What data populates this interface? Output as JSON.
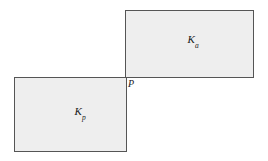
{
  "figure": {
    "background_color": "#ffffff",
    "width": 268,
    "height": 161,
    "shapes": [
      {
        "name": "upper-rectangle",
        "label_base": "K",
        "label_subscript": "a",
        "fill_color": "#eeeeee",
        "stroke_color": "#555555",
        "x": 125,
        "y": 10,
        "width": 129,
        "height": 68,
        "label_cx": 193,
        "label_cy": 41
      },
      {
        "name": "lower-rectangle",
        "label_base": "K",
        "label_subscript": "p",
        "fill_color": "#eeeeee",
        "stroke_color": "#555555",
        "x": 14,
        "y": 77,
        "width": 113,
        "height": 75,
        "label_cx": 80,
        "label_cy": 113
      }
    ],
    "point": {
      "name": "corner-point-p",
      "label": "P",
      "x": 128,
      "y": 79
    }
  }
}
